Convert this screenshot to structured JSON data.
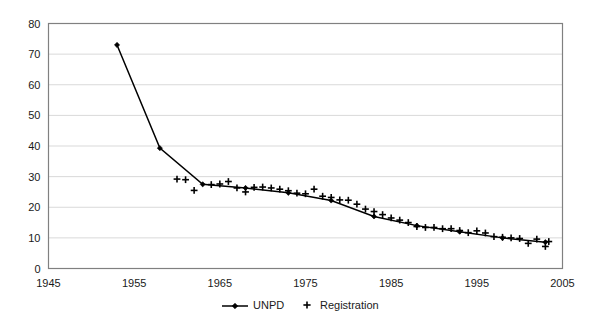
{
  "chart_data": {
    "type": "line",
    "title": "",
    "subtitle": "",
    "xlabel": "",
    "ylabel": "",
    "xlim": [
      1945,
      2005
    ],
    "ylim": [
      0,
      80
    ],
    "xticks": [
      1945,
      1955,
      1965,
      1975,
      1985,
      1995,
      2005
    ],
    "yticks": [
      0,
      10,
      20,
      30,
      40,
      50,
      60,
      70,
      80
    ],
    "grid": "horizontal",
    "legend_position": "bottom-center",
    "series": [
      {
        "name": "UNPD",
        "marker": "diamond",
        "line": true,
        "color": "#000000",
        "points": [
          [
            1953,
            73.0
          ],
          [
            1958,
            39.3
          ],
          [
            1963,
            27.5
          ],
          [
            1968,
            26.3
          ],
          [
            1973,
            24.7
          ],
          [
            1978,
            22.2
          ],
          [
            1983,
            17.0
          ],
          [
            1988,
            14.0
          ],
          [
            1993,
            12.0
          ],
          [
            1998,
            10.0
          ],
          [
            2003,
            8.6
          ]
        ]
      },
      {
        "name": "Registration",
        "marker": "plus",
        "line": false,
        "color": "#000000",
        "points": [
          [
            1960,
            29.2
          ],
          [
            1961,
            29.0
          ],
          [
            1962,
            25.5
          ],
          [
            1964,
            27.4
          ],
          [
            1965,
            27.6
          ],
          [
            1966,
            28.4
          ],
          [
            1967,
            26.3
          ],
          [
            1968,
            25.0
          ],
          [
            1969,
            26.5
          ],
          [
            1970,
            26.6
          ],
          [
            1971,
            26.3
          ],
          [
            1972,
            25.9
          ],
          [
            1973,
            25.4
          ],
          [
            1974,
            24.6
          ],
          [
            1975,
            24.4
          ],
          [
            1976,
            25.9
          ],
          [
            1977,
            23.6
          ],
          [
            1978,
            23.2
          ],
          [
            1979,
            22.4
          ],
          [
            1980,
            22.3
          ],
          [
            1981,
            21.0
          ],
          [
            1982,
            19.4
          ],
          [
            1983,
            18.6
          ],
          [
            1984,
            17.6
          ],
          [
            1985,
            16.5
          ],
          [
            1986,
            15.8
          ],
          [
            1987,
            15.0
          ],
          [
            1988,
            13.7
          ],
          [
            1989,
            13.4
          ],
          [
            1990,
            13.4
          ],
          [
            1991,
            13.0
          ],
          [
            1992,
            13.0
          ],
          [
            1993,
            12.4
          ],
          [
            1994,
            11.7
          ],
          [
            1995,
            12.3
          ],
          [
            1996,
            11.6
          ],
          [
            1997,
            10.4
          ],
          [
            1998,
            10.2
          ],
          [
            1999,
            10.0
          ],
          [
            2000,
            9.8
          ],
          [
            2001,
            8.2
          ],
          [
            2002,
            9.6
          ],
          [
            2003,
            7.2
          ],
          [
            2003.4,
            8.8
          ]
        ]
      }
    ]
  },
  "legend": {
    "items": [
      {
        "label": "UNPD",
        "marker": "line-diamond"
      },
      {
        "label": "Registration",
        "marker": "plus"
      }
    ]
  },
  "axes": {
    "y_tick_labels": [
      "0",
      "10",
      "20",
      "30",
      "40",
      "50",
      "60",
      "70",
      "80"
    ],
    "x_tick_labels": [
      "1945",
      "1955",
      "1965",
      "1975",
      "1985",
      "1995",
      "2005"
    ]
  },
  "style": {
    "plot_border_color": "#808080",
    "gridline_color": "#d9d9d9",
    "series_color": "#000000",
    "background": "#ffffff"
  }
}
